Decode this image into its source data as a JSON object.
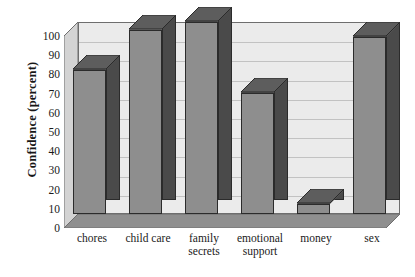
{
  "chart_data": {
    "type": "bar",
    "title": "",
    "subtitle": "",
    "xlabel": "",
    "ylabel": "Confidence  (percent)",
    "categories": [
      "chores",
      "child care",
      "family\nsecrets",
      "emotional\nsupport",
      "money",
      "sex"
    ],
    "values": [
      75,
      96,
      100,
      63,
      5,
      92
    ],
    "ylim": [
      0,
      100
    ],
    "yticks": [
      "0",
      "10",
      "20",
      "30",
      "40",
      "50",
      "60",
      "70",
      "80",
      "90",
      "100"
    ],
    "grid": true,
    "legend": "none",
    "style": "3d-bar",
    "colors": {
      "bar_front": "#8e8e8e",
      "bar_side": "#4a4a4a",
      "bar_top": "#5d5d5d",
      "bar_edge": "#2b2b2b",
      "plot_background": "#ebebeb",
      "floor": "#8f8f8f",
      "left_wall": "#d3d3d3",
      "gridline": "#c2c2c2",
      "axis": "#6e6e6e",
      "text": "#1a1a1a"
    }
  }
}
